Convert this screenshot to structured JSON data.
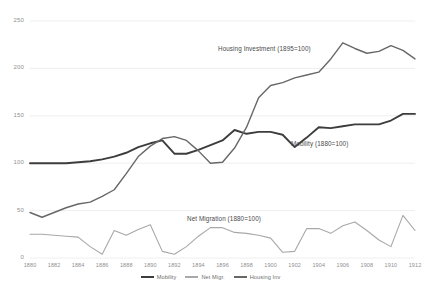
{
  "chart_data": {
    "type": "line",
    "title": "",
    "xlabel": "",
    "ylabel": "",
    "xlim": [
      1880,
      1912
    ],
    "ylim": [
      0,
      250
    ],
    "ytick_step": 50,
    "xtick_step": 2,
    "grid": "horizontal",
    "legend_position": "bottom-center",
    "yticks": [
      "0",
      "50",
      "100",
      "150",
      "200",
      "250"
    ],
    "xticks": [
      "1880",
      "1882",
      "1884",
      "1886",
      "1888",
      "1890",
      "1892",
      "1894",
      "1896",
      "1898",
      "1900",
      "1902",
      "1904",
      "1906",
      "1908",
      "1910",
      "1912"
    ],
    "x": [
      1880,
      1881,
      1882,
      1883,
      1884,
      1885,
      1886,
      1887,
      1888,
      1889,
      1890,
      1891,
      1892,
      1893,
      1894,
      1895,
      1896,
      1897,
      1898,
      1899,
      1900,
      1901,
      1902,
      1903,
      1904,
      1905,
      1906,
      1907,
      1908,
      1909,
      1910,
      1911,
      1912
    ],
    "series": [
      {
        "name": "Mobility",
        "label": "Mobility (1880=100)",
        "color": "#3d3d3d",
        "width": 1.9,
        "values": [
          100,
          100,
          100,
          100,
          101,
          102,
          104,
          107,
          111,
          117,
          121,
          124,
          110,
          110,
          114,
          119,
          124,
          135,
          131,
          133,
          133,
          130,
          117,
          127,
          138,
          137,
          139,
          141,
          141,
          141,
          145,
          152,
          152
        ]
      },
      {
        "name": "Net Migr.",
        "label": "Net Migration (1880=100)",
        "color": "#a8a8a8",
        "width": 1.1,
        "values": [
          25,
          25,
          24,
          23,
          22,
          12,
          4,
          29,
          24,
          30,
          35,
          7,
          4,
          12,
          23,
          32,
          32,
          27,
          26,
          24,
          21,
          6,
          7,
          31,
          31,
          26,
          34,
          38,
          29,
          19,
          12,
          45,
          29
        ]
      },
      {
        "name": "Housing Inv",
        "label": "Housing Investment (1895=100)",
        "color": "#676767",
        "width": 1.4,
        "values": [
          48,
          43,
          48,
          53,
          57,
          59,
          65,
          72,
          89,
          107,
          118,
          126,
          128,
          124,
          113,
          100,
          101,
          116,
          138,
          169,
          182,
          185,
          190,
          193,
          196,
          210,
          227,
          221,
          216,
          218,
          224,
          219,
          210
        ]
      }
    ]
  },
  "annotations": [
    {
      "id": "housing",
      "text": "Housing Investment (1895=100)"
    },
    {
      "id": "mobility",
      "text": "Mobility (1880=100)"
    },
    {
      "id": "netmig",
      "text": "Net Migration (1880=100)"
    }
  ],
  "legend": {
    "items": [
      {
        "label": "Mobility",
        "color": "#3d3d3d"
      },
      {
        "label": "Net Migr.",
        "color": "#a8a8a8"
      },
      {
        "label": "Housing Inv",
        "color": "#676767"
      }
    ]
  },
  "colors": {
    "background": "#ffffff",
    "gridline": "#e8e8e8",
    "tick_text": "#8f8f8f",
    "annotation_text": "#4a4a4a"
  }
}
